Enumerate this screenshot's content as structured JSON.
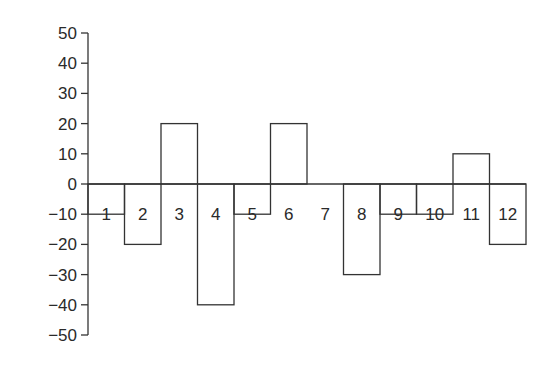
{
  "chart_data": {
    "type": "bar",
    "title": "",
    "xlabel": "",
    "ylabel": "",
    "categories": [
      "1",
      "2",
      "3",
      "4",
      "5",
      "6",
      "7",
      "8",
      "9",
      "10",
      "11",
      "12"
    ],
    "values": [
      -10,
      -20,
      20,
      -40,
      -10,
      20,
      0,
      -30,
      -10,
      -10,
      10,
      -20
    ],
    "ylim": [
      -50,
      50
    ],
    "yticks": [
      50,
      40,
      30,
      20,
      10,
      0,
      -10,
      -20,
      -30,
      -40,
      -50
    ],
    "ytick_labels": [
      "50",
      "40",
      "30",
      "20",
      "10",
      "0",
      "−10",
      "−20",
      "−30",
      "−40",
      "−50"
    ],
    "grid": false,
    "legend": null,
    "bar_style": "outline, no fill, adjacent bars, category labels drawn inside plot at y=-10 level",
    "colors": {
      "stroke": "#333333",
      "background": "#ffffff"
    }
  }
}
